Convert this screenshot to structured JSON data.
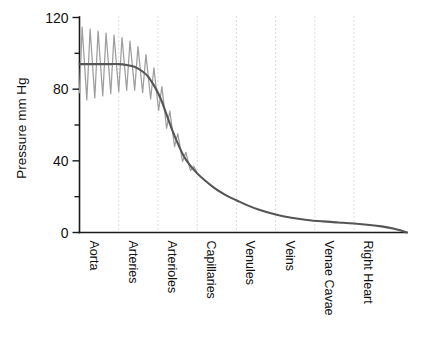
{
  "chart_data": {
    "type": "line",
    "title": "",
    "xlabel": "",
    "ylabel": "Pressure mm Hg",
    "ylim": [
      0,
      120
    ],
    "yticks": [
      0,
      40,
      80,
      120
    ],
    "ytick_labels": [
      "0",
      "40",
      "80",
      "120"
    ],
    "yminor_ticks": [
      20,
      60,
      100
    ],
    "grid": "vertical-dotted-at-categories",
    "legend": "none",
    "categories": [
      "Aorta",
      "Arteries",
      "Arterioles",
      "Capillaries",
      "Venules",
      "Veins",
      "Venae Cavae",
      "Right Heart"
    ],
    "category_positions": [
      0,
      1,
      2,
      3,
      4,
      5,
      6,
      7
    ],
    "xlim": [
      0,
      8.35
    ],
    "series": [
      {
        "name": "Mean pressure",
        "color": "#555555",
        "style": "solid",
        "description": "Mean arterial to venous pressure decay curve",
        "x": [
          0.0,
          0.2,
          0.5,
          0.8,
          1.0,
          1.2,
          1.4,
          1.6,
          1.75,
          1.9,
          2.0,
          2.1,
          2.2,
          2.35,
          2.5,
          2.65,
          2.8,
          3.0,
          3.2,
          3.4,
          3.6,
          3.8,
          4.0,
          4.3,
          4.6,
          5.0,
          5.4,
          5.8,
          6.2,
          6.6,
          7.0,
          7.4,
          7.7,
          8.0,
          8.2,
          8.35
        ],
        "y": [
          94,
          94,
          94,
          94,
          94,
          93.5,
          92.5,
          90,
          87,
          82,
          78,
          73,
          67,
          58,
          50,
          43,
          38,
          33,
          29,
          25.5,
          22.5,
          20,
          18,
          15,
          12.5,
          10,
          8.2,
          7.0,
          6.2,
          5.6,
          5.0,
          4.2,
          3.4,
          2.2,
          1.1,
          0
        ]
      },
      {
        "name": "Pulsatile pressure",
        "color": "#9e9e9e",
        "style": "solid",
        "description": "Systolic/diastolic oscillation damping from aorta through arterioles",
        "systolic_start": 120,
        "diastolic_start": 78,
        "cycles": 15,
        "damping_end_x": 3.05
      }
    ],
    "annotations": [
      {
        "text": "systolic peak",
        "value": 120,
        "at": "Aorta"
      },
      {
        "text": "diastolic trough",
        "value": 78,
        "at": "Aorta"
      },
      {
        "text": "mean",
        "value": 94,
        "at": "Aorta"
      },
      {
        "text": "mean",
        "value": 35,
        "at": "Capillaries"
      },
      {
        "text": "mean",
        "value": 0,
        "at": "Right Heart"
      }
    ]
  },
  "axes": {
    "y_title": "Pressure mm Hg"
  }
}
